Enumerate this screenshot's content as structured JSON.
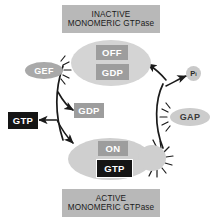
{
  "diagram": {
    "title_top": {
      "line1": "INACTIVE",
      "line2": "MONOMERIC GTPase"
    },
    "title_bottom": {
      "line1": "ACTIVE",
      "line2": "MONOMERIC GTPase"
    },
    "inactive_state": {
      "state_label": "OFF",
      "nucleotide_label": "GDP",
      "blob_color": "#d4d4d4",
      "state_box_color": "#9d9d9d",
      "nucleotide_box_color": "#9d9d9d"
    },
    "active_state": {
      "state_label": "ON",
      "nucleotide_label": "GTP",
      "blob_color": "#cfcfcf",
      "state_box_color": "#9d9d9d",
      "nucleotide_box_color": "#151515"
    },
    "regulators": {
      "gef": {
        "label": "GEF",
        "color": "#a9a9a9"
      },
      "gap": {
        "label": "GAP",
        "color": "#cccccc"
      }
    },
    "free_nucleotides": {
      "gtp_in": {
        "label": "GTP",
        "color": "#151515"
      },
      "gdp_out": {
        "label": "GDP",
        "color": "#9d9d9d"
      }
    },
    "phosphate": {
      "label": "P",
      "subscript": "i",
      "color": "#c9c9c9"
    },
    "arrow_color": "#1a1a1a",
    "background": "#ffffff"
  }
}
